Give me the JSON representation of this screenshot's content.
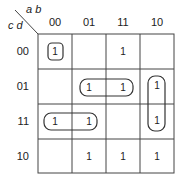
{
  "kmap": {
    "col_var_label": "a b",
    "row_var_label": "c d",
    "col_headers": [
      "00",
      "01",
      "11",
      "10"
    ],
    "row_headers": [
      "00",
      "01",
      "11",
      "10"
    ],
    "cells": [
      [
        "1",
        "",
        "1",
        ""
      ],
      [
        "",
        "1",
        "1",
        "1"
      ],
      [
        "1",
        "1",
        "",
        "1"
      ],
      [
        "",
        "1",
        "1",
        "1"
      ]
    ],
    "groupings": [
      {
        "name": "group-cd00-ab00",
        "cells": [
          [
            0,
            0
          ]
        ]
      },
      {
        "name": "group-cd01-ab01-ab11",
        "cells": [
          [
            1,
            1
          ],
          [
            1,
            2
          ]
        ]
      },
      {
        "name": "group-cd11-ab00-ab01",
        "cells": [
          [
            2,
            0
          ],
          [
            2,
            1
          ]
        ]
      },
      {
        "name": "group-ab10-cd01-cd11",
        "cells": [
          [
            1,
            3
          ],
          [
            2,
            3
          ]
        ]
      }
    ],
    "colors": {
      "line": "#444444",
      "text": "#222222",
      "background": "#ffffff"
    }
  }
}
